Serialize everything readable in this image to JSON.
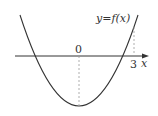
{
  "diagram": {
    "type": "function-graph",
    "curve_label": "y=f(x)",
    "origin_label": "0",
    "tick_label": "3",
    "axis_label": "x",
    "curve": "parabola opening upward, vertex below x-axis at x=0",
    "dashed_guides": [
      "vertical from vertex to x-axis at 0",
      "vertical from curve to x-axis at 3"
    ],
    "colors": {
      "line": "#333333",
      "dashed": "#999999"
    }
  }
}
